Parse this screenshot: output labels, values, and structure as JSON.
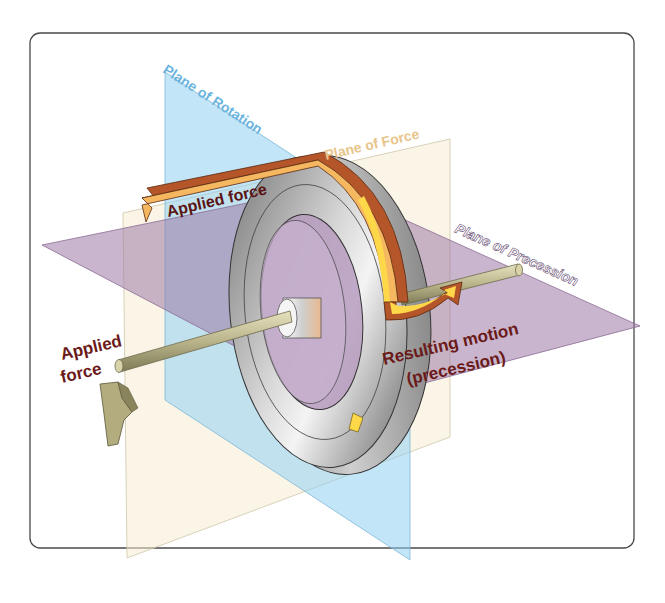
{
  "diagram": {
    "planes": {
      "rotation": {
        "label": "Plane of Rotation",
        "color": "#7fc4ec"
      },
      "force": {
        "label": "Plane of Force",
        "color": "#f0d8a8"
      },
      "precession": {
        "label": "Plane of Precession",
        "color": "#a98bb0"
      }
    },
    "labels": {
      "applied_force_top": "Applied force",
      "applied_force_left_line1": "Applied",
      "applied_force_left_line2": "force",
      "resulting_motion_line1": "Resulting motion",
      "resulting_motion_line2": "(precession)"
    },
    "colors": {
      "label_text": "#6b1a1a",
      "arrow_orange": "#f5b860",
      "arrow_brown": "#b5562a",
      "arrow_yellow": "#ffd84a",
      "wheel_gray": "#a8a8a8",
      "axle": "#b8b38a",
      "frame_border": "#444444"
    }
  }
}
